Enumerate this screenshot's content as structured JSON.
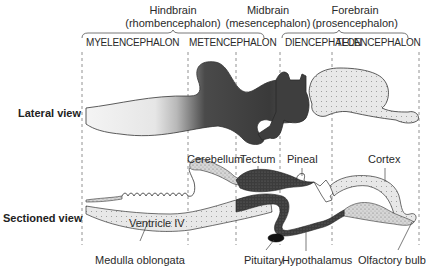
{
  "divisions": [
    {
      "name": "Hindbrain",
      "alt": "(rhombencephalon)"
    },
    {
      "name": "Midbrain",
      "alt": "(mesencephalon)"
    },
    {
      "name": "Forebrain",
      "alt": "(prosencephalon)"
    }
  ],
  "subdivisions": [
    "MYELENCEPHALON",
    "METENCEPHALON",
    "DIENCEPHALON",
    "TELENCEPHALON"
  ],
  "views": {
    "lateral": "Lateral view",
    "sectioned": "Sectioned view"
  },
  "structures": {
    "cerebellum": "Cerebellum",
    "tectum": "Tectum",
    "pineal": "Pineal",
    "cortex": "Cortex",
    "ventricle": "Ventricle IV",
    "medulla": "Medulla oblongata",
    "pituitary": "Pituitary",
    "hypothalamus": "Hypothalamus",
    "olfactory": "Olfactory bulb"
  },
  "colors": {
    "hindbrain_fill": "#d9d9d9",
    "midbrain_fill": "#4a4a4a",
    "forebrain_fill": "#cfcfcf",
    "outline": "#333333"
  }
}
